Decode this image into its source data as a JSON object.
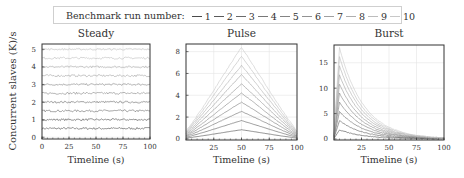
{
  "legend": {
    "title": "Benchmark run number:",
    "entries": [
      "1",
      "2",
      "3",
      "4",
      "5",
      "6",
      "7",
      "8",
      "9",
      "10"
    ],
    "colors": [
      "#4a4a4a",
      "#5a5a5a",
      "#6a6a6a",
      "#777777",
      "#848484",
      "#929292",
      "#a0a0a0",
      "#aeaeae",
      "#bcbcbc",
      "#c8c8c8"
    ]
  },
  "shared": {
    "ylabel": "Concurrent slaves (K)/s",
    "xlabel": "Timeline (s)"
  },
  "chart_data": [
    {
      "type": "line",
      "title": "Steady",
      "xlabel": "Timeline (s)",
      "ylabel": "Concurrent slaves (K)/s",
      "xlim": [
        0,
        100
      ],
      "ylim": [
        -0.1,
        5.3
      ],
      "xticks": [
        0,
        25,
        50,
        75,
        100
      ],
      "yticks": [
        0,
        1,
        2,
        3,
        4,
        5
      ],
      "grid": true,
      "description": "Run k stays roughly constant at 0.5*k with small noise",
      "series": [
        {
          "name": "1",
          "level": 0.5
        },
        {
          "name": "2",
          "level": 1.0
        },
        {
          "name": "3",
          "level": 1.5
        },
        {
          "name": "4",
          "level": 2.0
        },
        {
          "name": "5",
          "level": 2.5
        },
        {
          "name": "6",
          "level": 3.0
        },
        {
          "name": "7",
          "level": 3.5
        },
        {
          "name": "8",
          "level": 4.0
        },
        {
          "name": "9",
          "level": 4.5
        },
        {
          "name": "10",
          "level": 5.0
        }
      ]
    },
    {
      "type": "line",
      "title": "Pulse",
      "xlabel": "Timeline (s)",
      "xlim": [
        0,
        100
      ],
      "ylim": [
        -0.1,
        8.7
      ],
      "xticks": [
        25,
        50,
        75,
        100
      ],
      "yticks": [
        0,
        2,
        4,
        6,
        8
      ],
      "grid": true,
      "description": "Symmetric pulse peaking at t=50s; run k peak ~0.84*k, endpoints ~0.1*peak",
      "series": [
        {
          "name": "1",
          "peak": 0.84
        },
        {
          "name": "2",
          "peak": 1.68
        },
        {
          "name": "3",
          "peak": 2.52
        },
        {
          "name": "4",
          "peak": 3.36
        },
        {
          "name": "5",
          "peak": 4.2
        },
        {
          "name": "6",
          "peak": 5.04
        },
        {
          "name": "7",
          "peak": 5.88
        },
        {
          "name": "8",
          "peak": 6.72
        },
        {
          "name": "9",
          "peak": 7.56
        },
        {
          "name": "10",
          "peak": 8.4
        }
      ]
    },
    {
      "type": "line",
      "title": "Burst",
      "xlabel": "Timeline (s)",
      "xlim": [
        0,
        100
      ],
      "ylim": [
        -0.2,
        18.5
      ],
      "xticks": [
        25,
        50,
        75,
        100
      ],
      "yticks": [
        0,
        5,
        10,
        15
      ],
      "grid": true,
      "description": "Sharp rise to peak at t~5s then exponential decay; run k peak ~1.8*k",
      "series": [
        {
          "name": "1",
          "peak": 1.8
        },
        {
          "name": "2",
          "peak": 3.6
        },
        {
          "name": "3",
          "peak": 5.4
        },
        {
          "name": "4",
          "peak": 7.2
        },
        {
          "name": "5",
          "peak": 9.0
        },
        {
          "name": "6",
          "peak": 10.8
        },
        {
          "name": "7",
          "peak": 12.6
        },
        {
          "name": "8",
          "peak": 14.4
        },
        {
          "name": "9",
          "peak": 16.2
        },
        {
          "name": "10",
          "peak": 18.0
        }
      ]
    }
  ]
}
